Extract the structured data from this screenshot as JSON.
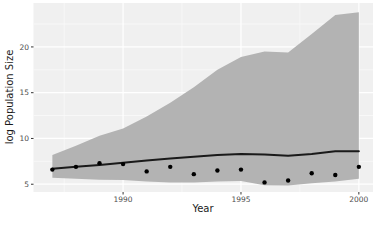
{
  "chart_data": {
    "type": "line",
    "title": "",
    "xlabel": "Year",
    "ylabel": "log Population Size",
    "x": [
      1987,
      1988,
      1989,
      1990,
      1991,
      1992,
      1993,
      1994,
      1995,
      1996,
      1997,
      1998,
      1999,
      2000
    ],
    "series": [
      {
        "name": "observed-points",
        "type": "scatter",
        "values": [
          6.6,
          6.9,
          7.3,
          7.2,
          6.4,
          6.9,
          6.1,
          6.5,
          6.6,
          5.2,
          5.4,
          6.2,
          6.0,
          6.9
        ]
      },
      {
        "name": "trend-line",
        "type": "line",
        "values": [
          6.7,
          6.9,
          7.1,
          7.35,
          7.6,
          7.8,
          8.0,
          8.2,
          8.3,
          8.25,
          8.1,
          8.3,
          8.6,
          8.6
        ]
      },
      {
        "name": "ribbon-upper",
        "type": "area-bound",
        "values": [
          8.2,
          9.2,
          10.3,
          11.1,
          12.4,
          13.9,
          15.6,
          17.5,
          18.9,
          19.5,
          19.4,
          21.4,
          23.5,
          23.8
        ]
      },
      {
        "name": "ribbon-lower",
        "type": "area-bound",
        "values": [
          5.7,
          5.6,
          5.5,
          5.45,
          5.3,
          5.2,
          5.2,
          5.3,
          5.35,
          4.9,
          4.85,
          5.1,
          5.3,
          5.6
        ]
      }
    ],
    "x_ticks": [
      1990,
      1995,
      2000
    ],
    "y_ticks": [
      5,
      10,
      15,
      20
    ],
    "x_minor_ticks": [
      1987.5,
      1992.5,
      1997.5
    ],
    "y_minor_ticks": [
      7.5,
      12.5,
      17.5,
      22.5
    ],
    "xlim": [
      1986.2,
      2000.6
    ],
    "ylim": [
      4.15,
      24.8
    ],
    "grid": true,
    "legend": "none",
    "colors": {
      "panel_bg": "#f0f0f0",
      "grid_major": "#ffffff",
      "grid_minor": "#fafafa",
      "ribbon": "#b3b3b3",
      "line": "#1a1a1a",
      "point": "#000000",
      "tick_mark": "#333333",
      "axis_text": "#4d4d4d",
      "axis_title": "#1a1a1a"
    }
  }
}
